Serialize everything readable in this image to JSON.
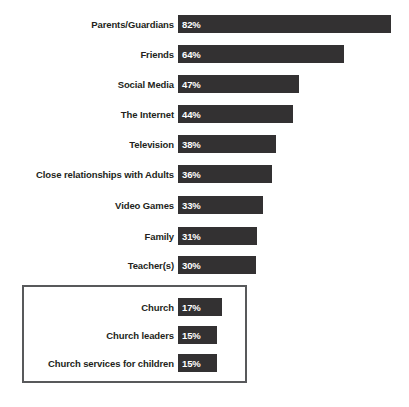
{
  "chart_data": {
    "type": "bar",
    "orientation": "horizontal",
    "title": "",
    "subtitle": "",
    "xlabel": "",
    "ylabel": "",
    "xlim": [
      0,
      82
    ],
    "grid": false,
    "legend": null,
    "value_suffix": "%",
    "categories": [
      "Parents/Guardians",
      "Friends",
      "Social Media",
      "The Internet",
      "Television",
      "Close relationships with Adults",
      "Video Games",
      "Family",
      "Teacher(s)",
      "Church",
      "Church leaders",
      "Church services for children"
    ],
    "values": [
      82,
      64,
      47,
      44,
      38,
      36,
      33,
      31,
      30,
      17,
      15,
      15
    ],
    "labels": [
      "82%",
      "64%",
      "47%",
      "44%",
      "38%",
      "36%",
      "33%",
      "31%",
      "30%",
      "17%",
      "15%",
      "15%"
    ],
    "annotations": [
      {
        "type": "highlight-box",
        "encloses": [
          "Church",
          "Church leaders",
          "Church services for children"
        ]
      }
    ],
    "colors": {
      "bar": "#333132",
      "bar_value_text": "#ffffff",
      "category_label": "#231f20",
      "highlight_box_border": "#58595b",
      "background": "#ffffff"
    }
  },
  "bars": [
    {
      "label": "Parents/Guardians",
      "value_text": "82%",
      "value": 82,
      "top": 15,
      "width": 213
    },
    {
      "label": "Friends",
      "value_text": "64%",
      "value": 64,
      "top": 45,
      "width": 166
    },
    {
      "label": "Social Media",
      "value_text": "47%",
      "value": 47,
      "top": 75,
      "width": 121
    },
    {
      "label": "The Internet",
      "value_text": "44%",
      "value": 44,
      "top": 105,
      "width": 115
    },
    {
      "label": "Television",
      "value_text": "38%",
      "value": 38,
      "top": 135,
      "width": 98
    },
    {
      "label": "Close relationships with Adults",
      "value_text": "36%",
      "value": 36,
      "top": 165,
      "width": 94
    },
    {
      "label": "Video Games",
      "value_text": "33%",
      "value": 33,
      "top": 196,
      "width": 85
    },
    {
      "label": "Family",
      "value_text": "31%",
      "value": 31,
      "top": 227,
      "width": 79
    },
    {
      "label": "Teacher(s)",
      "value_text": "30%",
      "value": 30,
      "top": 256,
      "width": 78
    },
    {
      "label": "Church",
      "value_text": "17%",
      "value": 17,
      "top": 298,
      "width": 44
    },
    {
      "label": "Church leaders",
      "value_text": "15%",
      "value": 15,
      "top": 326,
      "width": 39
    },
    {
      "label": "Church services for children",
      "value_text": "15%",
      "value": 15,
      "top": 354,
      "width": 39
    }
  ]
}
